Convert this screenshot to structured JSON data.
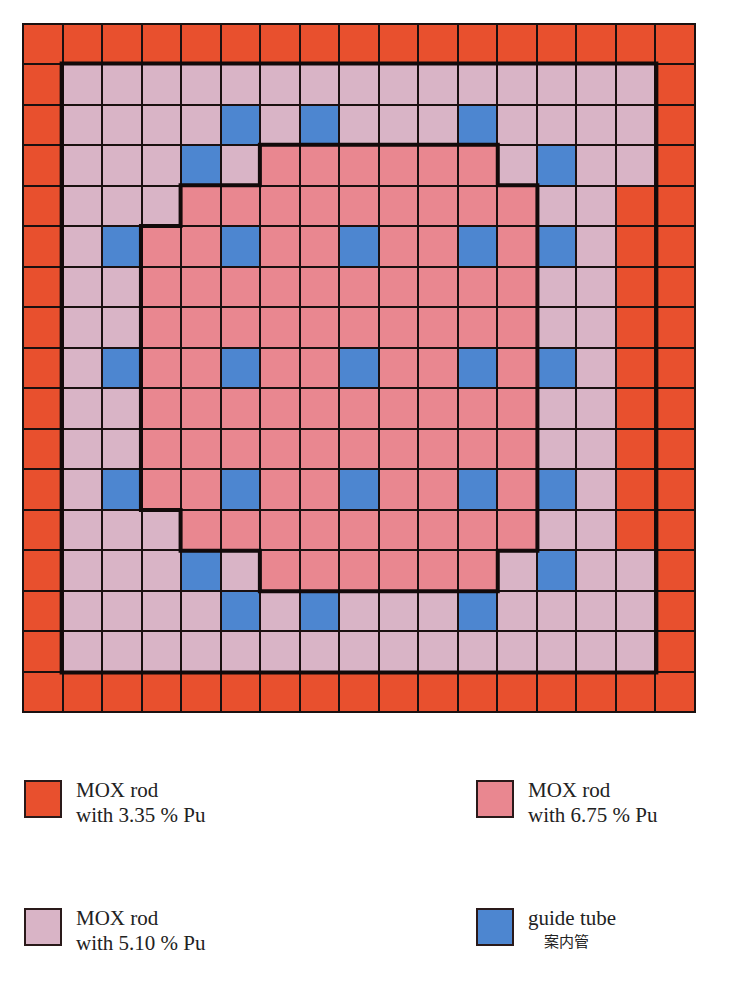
{
  "diagram": {
    "title": "",
    "grid_size": 17,
    "cell_codes": {
      "o": "MOX rod with 3.35 % Pu",
      "l": "MOX rod with 5.10 % Pu",
      "p": "MOX rod with 6.75 % Pu",
      "g": "guide tube"
    },
    "colors": {
      "o": "#e8502e",
      "l": "#d9b4c6",
      "p": "#e98790",
      "g": "#4d86d0",
      "line": "#1a1010"
    },
    "rows": [
      "ooooooooooooooooo",
      "olllllllllllllllo",
      "ollllglglllgllllo",
      "olllglpppppplgllo",
      "olllpppppppppllo",
      "olgppgppgppgpglo",
      "ollppppppppppllo",
      "ollppppppppppllo",
      "olgppgppgppgpglo",
      "ollppppppppppllo",
      "ollppppppppppllo",
      "olgppgppgppgpglo",
      "olllpppppppppllo",
      "olllglpppppplgllo",
      "ollllglglllgllllo",
      "olllllllllllllllo",
      "ooooooooooooooooo"
    ]
  },
  "legend": {
    "items": [
      {
        "key": "o",
        "line1": "MOX rod",
        "line2": "with 3.35 % Pu",
        "sub": ""
      },
      {
        "key": "p",
        "line1": "MOX rod",
        "line2": "with 6.75 % Pu",
        "sub": ""
      },
      {
        "key": "l",
        "line1": "MOX rod",
        "line2": "with 5.10 % Pu",
        "sub": ""
      },
      {
        "key": "g",
        "line1": "guide tube",
        "line2": "",
        "sub": "案内管"
      }
    ]
  }
}
